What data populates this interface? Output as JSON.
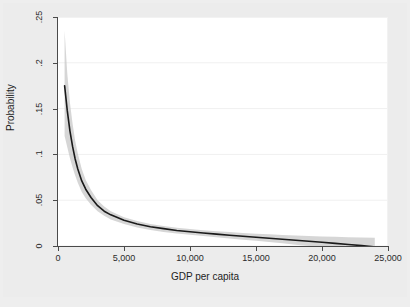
{
  "figure": {
    "background_color": "#ececec",
    "plot_background_color": "#ffffff"
  },
  "chart_data": {
    "type": "line",
    "title": "",
    "subtitle": "",
    "xlabel": "GDP per capita",
    "ylabel": "Probability",
    "xlim": [
      0,
      25000
    ],
    "ylim": [
      0,
      0.25
    ],
    "grid": "horizontal",
    "legend": "none",
    "xticks": [
      0,
      5000,
      10000,
      15000,
      20000,
      25000
    ],
    "xticklabels": [
      "0",
      "5,000",
      "10,000",
      "15,000",
      "20,000",
      "25,000"
    ],
    "yticks": [
      0,
      0.05,
      0.1,
      0.15,
      0.2,
      0.25
    ],
    "yticklabels": [
      "0",
      ".05",
      ".1",
      ".15",
      ".2",
      ".25"
    ],
    "series": [
      {
        "name": "Predicted probability",
        "color": "#1a1a1a",
        "x": [
          500,
          700,
          900,
          1100,
          1300,
          1500,
          1800,
          2100,
          2500,
          3000,
          3500,
          4000,
          5000,
          6000,
          7000,
          8000,
          9000,
          10000,
          11000,
          12000,
          13000,
          14000,
          15000,
          16000,
          17000,
          18000,
          19000,
          20000,
          21000,
          22000,
          23000,
          24000
        ],
        "y": [
          0.175,
          0.148,
          0.126,
          0.109,
          0.095,
          0.084,
          0.071,
          0.062,
          0.053,
          0.044,
          0.038,
          0.034,
          0.028,
          0.024,
          0.021,
          0.019,
          0.017,
          0.0155,
          0.0142,
          0.013,
          0.0118,
          0.0107,
          0.0096,
          0.0085,
          0.0074,
          0.0063,
          0.0052,
          0.0041,
          0.0029,
          0.0017,
          0.0004,
          -0.001
        ]
      }
    ],
    "confidence_band": {
      "name": "95% confidence interval",
      "color": "#c8c8c8",
      "opacity": 0.75,
      "x": [
        500,
        700,
        900,
        1100,
        1300,
        1500,
        1800,
        2100,
        2500,
        3000,
        3500,
        4000,
        5000,
        6000,
        7000,
        8000,
        9000,
        10000,
        11000,
        12000,
        13000,
        14000,
        15000,
        16000,
        17000,
        18000,
        19000,
        20000,
        21000,
        22000,
        23000,
        24000
      ],
      "upper": [
        0.235,
        0.189,
        0.157,
        0.134,
        0.115,
        0.101,
        0.084,
        0.072,
        0.061,
        0.05,
        0.043,
        0.038,
        0.0315,
        0.0272,
        0.0241,
        0.0218,
        0.02,
        0.0185,
        0.0173,
        0.0162,
        0.0152,
        0.0143,
        0.0135,
        0.0128,
        0.0121,
        0.0115,
        0.011,
        0.0105,
        0.01,
        0.0096,
        0.0092,
        0.0089
      ],
      "lower": [
        0.12,
        0.108,
        0.096,
        0.086,
        0.077,
        0.069,
        0.059,
        0.052,
        0.045,
        0.038,
        0.033,
        0.029,
        0.024,
        0.0203,
        0.0175,
        0.0154,
        0.0137,
        0.0122,
        0.0108,
        0.0095,
        0.0082,
        0.0069,
        0.0056,
        0.0043,
        0.0029,
        0.0015,
        0.0001,
        -0.0013,
        -0.0028,
        -0.0043,
        -0.0058,
        -0.0074
      ]
    }
  }
}
